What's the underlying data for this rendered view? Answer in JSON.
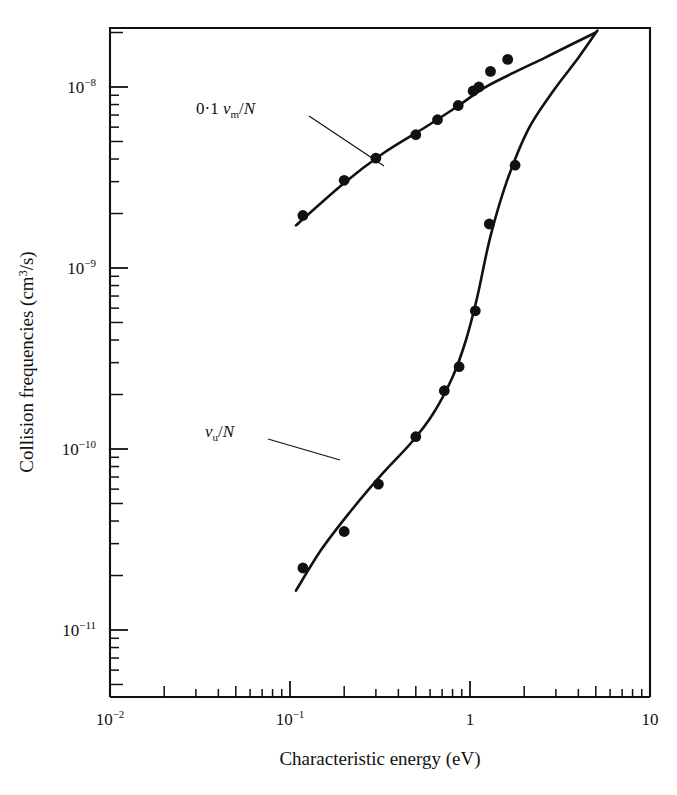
{
  "figure": {
    "title": "",
    "y_axis_title": "Collision frequencies (cm3/s)",
    "y_axis_title_parts": {
      "main": "Collision frequencies (cm",
      "sup": "3",
      "tail": "/s)"
    },
    "x_axis_title": "Characteristic energy (eV)",
    "caption_fragment": ""
  },
  "labels": {
    "upper_curve": {
      "prefix": "0·1 ",
      "symbol": "ν",
      "sub": "m",
      "suffix": "/N"
    },
    "lower_curve": {
      "prefix": "",
      "symbol": "ν",
      "sub": "u",
      "suffix": "/N"
    }
  },
  "ticks": {
    "x_major": [
      {
        "value": 0.01,
        "mantissa": "10",
        "exponent": "−2"
      },
      {
        "value": 0.1,
        "mantissa": "10",
        "exponent": "−1"
      },
      {
        "value": 1,
        "mantissa": "1",
        "exponent": ""
      },
      {
        "value": 10,
        "mantissa": "10",
        "exponent": ""
      }
    ],
    "y_major": [
      {
        "value": 1e-08,
        "mantissa": "10",
        "exponent": "−8"
      },
      {
        "value": 1e-09,
        "mantissa": "10",
        "exponent": "−9"
      },
      {
        "value": 1e-10,
        "mantissa": "10",
        "exponent": "−10"
      },
      {
        "value": 1e-11,
        "mantissa": "10",
        "exponent": "−11"
      }
    ]
  },
  "chart_data": {
    "type": "scatter",
    "title": "",
    "xlabel": "Characteristic energy (eV)",
    "ylabel": "Collision frequencies (cm3/s)",
    "xscale": "log",
    "yscale": "log",
    "xlim": [
      0.01,
      10
    ],
    "ylim": [
      3.5e-12,
      2.6e-08
    ],
    "grid": false,
    "legend": "inline-annotations",
    "series": [
      {
        "name": "0·1 νm/N",
        "marker": "filled-circle",
        "color": "#111111",
        "points": [
          {
            "x": 0.118,
            "y": 1.95e-09
          },
          {
            "x": 0.2,
            "y": 3.05e-09
          },
          {
            "x": 0.3,
            "y": 4.05e-09
          },
          {
            "x": 0.5,
            "y": 5.45e-09
          },
          {
            "x": 0.66,
            "y": 6.6e-09
          },
          {
            "x": 0.86,
            "y": 7.9e-09
          },
          {
            "x": 1.04,
            "y": 9.5e-09
          },
          {
            "x": 1.12,
            "y": 1e-08
          },
          {
            "x": 1.3,
            "y": 1.22e-08
          },
          {
            "x": 1.62,
            "y": 1.42e-08
          }
        ],
        "fit_curve": [
          {
            "x": 0.108,
            "y": 1.72e-09
          },
          {
            "x": 0.2,
            "y": 2.95e-09
          },
          {
            "x": 0.33,
            "y": 4.3e-09
          },
          {
            "x": 0.55,
            "y": 5.9e-09
          },
          {
            "x": 0.85,
            "y": 7.8e-09
          },
          {
            "x": 1.2,
            "y": 9.9e-09
          },
          {
            "x": 1.75,
            "y": 1.2e-08
          },
          {
            "x": 2.6,
            "y": 1.45e-08
          },
          {
            "x": 3.8,
            "y": 1.75e-08
          },
          {
            "x": 5.0,
            "y": 2e-08
          }
        ]
      },
      {
        "name": "νu/N",
        "marker": "filled-circle",
        "color": "#111111",
        "points": [
          {
            "x": 0.118,
            "y": 2.2e-11
          },
          {
            "x": 0.2,
            "y": 3.5e-11
          },
          {
            "x": 0.31,
            "y": 6.4e-11
          },
          {
            "x": 0.5,
            "y": 1.17e-10
          },
          {
            "x": 0.72,
            "y": 2.1e-10
          },
          {
            "x": 0.87,
            "y": 2.85e-10
          },
          {
            "x": 1.07,
            "y": 5.8e-10
          },
          {
            "x": 1.28,
            "y": 1.75e-09
          },
          {
            "x": 1.78,
            "y": 3.7e-09
          }
        ],
        "fit_curve": [
          {
            "x": 0.108,
            "y": 1.65e-11
          },
          {
            "x": 0.15,
            "y": 2.8e-11
          },
          {
            "x": 0.22,
            "y": 4.6e-11
          },
          {
            "x": 0.33,
            "y": 7.4e-11
          },
          {
            "x": 0.47,
            "y": 1.08e-10
          },
          {
            "x": 0.62,
            "y": 1.55e-10
          },
          {
            "x": 0.8,
            "y": 2.5e-10
          },
          {
            "x": 0.95,
            "y": 4e-10
          },
          {
            "x": 1.1,
            "y": 7e-10
          },
          {
            "x": 1.3,
            "y": 1.5e-09
          },
          {
            "x": 1.6,
            "y": 3e-09
          },
          {
            "x": 2.1,
            "y": 5.8e-09
          },
          {
            "x": 2.9,
            "y": 9.5e-09
          },
          {
            "x": 4.0,
            "y": 1.45e-08
          },
          {
            "x": 5.1,
            "y": 2.05e-08
          }
        ]
      }
    ]
  }
}
